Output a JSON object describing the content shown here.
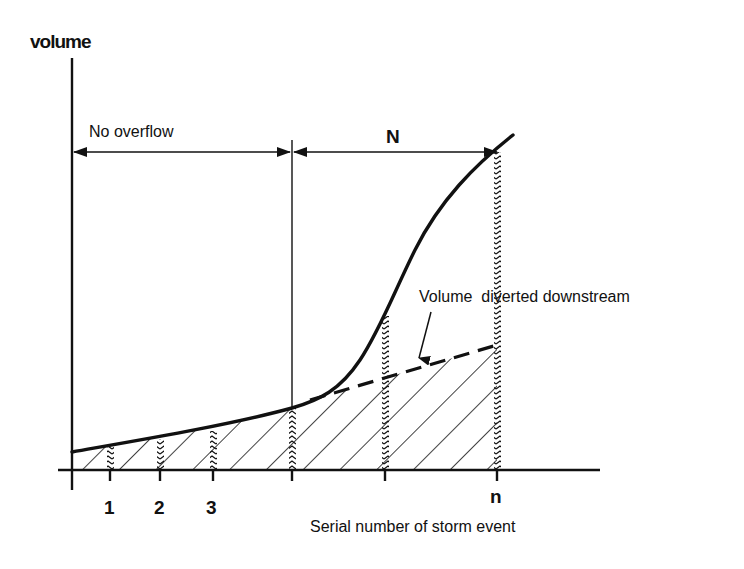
{
  "diagram": {
    "y_axis_label": "volume",
    "x_axis_label": "Serial number of storm event",
    "no_overflow_label": "No overflow",
    "overflow_count_label": "N",
    "annotation_label": "Volume  diverted downstream",
    "tick_labels": [
      "1",
      "2",
      "3",
      "n"
    ],
    "colors": {
      "ink": "#111111",
      "background": "#ffffff"
    },
    "elements": [
      "Cumulative volume curve (solid, rising steeply after overflow threshold)",
      "Volume diverted downstream line (dashed)",
      "Hatched area under diverted-volume line",
      "Double-headed arrow spanning No overflow region",
      "Double-headed arrow spanning N overflow events"
    ]
  }
}
